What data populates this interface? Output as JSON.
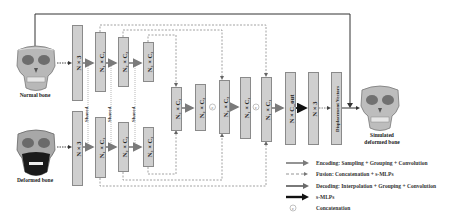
{
  "figure": {
    "inputs": {
      "normal_bone_label": "Normal bone",
      "deformed_bone_label": "Deformed bone"
    },
    "output": {
      "label_line1": "Simulated",
      "label_line2": "deformed bone"
    },
    "encoder_top": [
      {
        "id": "top-n3",
        "label": "N × 3"
      },
      {
        "id": "top-n1c1",
        "label": "N₁ × C₁"
      },
      {
        "id": "top-n2c2",
        "label": "N₂ × C₂"
      },
      {
        "id": "top-n3c3",
        "label": "N₃ × C₃"
      }
    ],
    "encoder_bottom": [
      {
        "id": "bot-n3",
        "label": "N × 3"
      },
      {
        "id": "bot-n1c1",
        "label": "N₁ × C₁"
      },
      {
        "id": "bot-n2c2",
        "label": "N₂ × C₂"
      },
      {
        "id": "bot-n3c3",
        "label": "N₃ × C₃"
      }
    ],
    "shared_label": "Shared",
    "decoder": [
      {
        "id": "fuse-n3c3",
        "label": "N₃ × C₃"
      },
      {
        "id": "dec-n2c2",
        "label": "N₂ × C₂"
      },
      {
        "id": "fuse-n2c2",
        "label": "N₂ × C₂"
      },
      {
        "id": "dec-n1c1",
        "label": "N₁ × C₁"
      },
      {
        "id": "fuse-n1c1",
        "label": "N₁ × C₁"
      }
    ],
    "head": [
      {
        "id": "n-cout",
        "label": "N × C_out"
      },
      {
        "id": "n-3",
        "label": "N × 3"
      },
      {
        "id": "disp",
        "label": "Displacement Vectors"
      }
    ],
    "concat_symbol": "c"
  },
  "legend": {
    "items": [
      {
        "type": "encoding-arrow",
        "label": "Encoding: Sampling + Grouping + Convolution"
      },
      {
        "type": "fusion-arrow",
        "label": "Fusion: Concatenation + s-MLPs"
      },
      {
        "type": "decoding-arrow",
        "label": "Decoding: Interpolation + Grouping + Convolution"
      },
      {
        "type": "smlp-arrow",
        "label": "s-MLPs"
      },
      {
        "type": "concat-symbol",
        "label": "Concatenation"
      }
    ]
  },
  "colors": {
    "box_fill": "#cfcfcf",
    "box_border": "#8a8a8a",
    "arrow_gray": "#7a7a7a",
    "arrow_black": "#111111",
    "dashed": "#8c8c8c"
  }
}
